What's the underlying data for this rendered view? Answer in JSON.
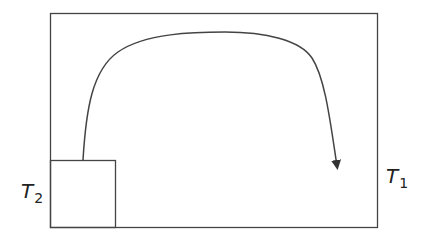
{
  "diagram": {
    "title": "",
    "stroke_color": "#444444",
    "outer_region": {
      "label_main": "T",
      "label_sub": "1",
      "x": 50,
      "y": 13,
      "width": 327,
      "height": 214
    },
    "inner_region": {
      "label_main": "T",
      "label_sub": "2",
      "x": 50,
      "y": 160,
      "width": 65,
      "height": 67
    },
    "flow_curve": {
      "description": "arrowed curve from top of small square, arching over, down into outer region",
      "path": "M 83 160 C 86 110, 92 70, 118 52 C 145 33, 195 32, 225 32 C 265 32, 300 40, 312 58 C 325 78, 330 120, 337 168",
      "arrow_tip": [
        338,
        172
      ]
    }
  }
}
